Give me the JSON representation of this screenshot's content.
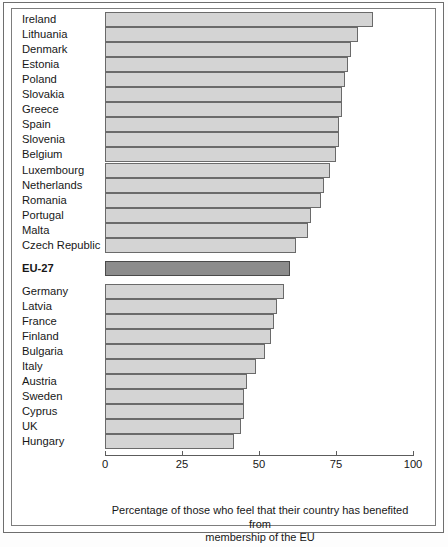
{
  "chart_data": {
    "type": "bar",
    "orientation": "horizontal",
    "title": "",
    "xlabel": "Percentage of those who feel that their country has benefited from membership of the EU",
    "ylabel": "",
    "xlim": [
      0,
      100
    ],
    "xticks": [
      0,
      25,
      50,
      75,
      100
    ],
    "xtick_labels": [
      "0",
      "25",
      "50",
      "75",
      "100"
    ],
    "grid": false,
    "legend": null,
    "categories": [
      "Ireland",
      "Lithuania",
      "Denmark",
      "Estonia",
      "Poland",
      "Slovakia",
      "Greece",
      "Spain",
      "Slovenia",
      "Belgium",
      "Luxembourg",
      "Netherlands",
      "Romania",
      "Portugal",
      "Malta",
      "Czech Republic",
      "EU-27",
      "Germany",
      "Latvia",
      "France",
      "Finland",
      "Bulgaria",
      "Italy",
      "Austria",
      "Sweden",
      "Cyprus",
      "UK",
      "Hungary"
    ],
    "values": [
      87,
      82,
      80,
      79,
      78,
      77,
      77,
      76,
      76,
      75,
      73,
      71,
      70,
      67,
      66,
      62,
      60,
      58,
      56,
      55,
      54,
      52,
      49,
      46,
      45,
      45,
      44,
      42
    ],
    "highlight_category": "EU-27",
    "colors": {
      "bar_fill": "#d4d4d4",
      "bar_edge": "#6a6a6a",
      "highlight_fill": "#8c8c8c",
      "highlight_edge": "#4a4a4a",
      "axis": "#5c5c5c",
      "text": "#171717",
      "background": "#ffffff"
    },
    "groups": [
      {
        "name": "above-average",
        "categories": [
          "Ireland",
          "Lithuania",
          "Denmark",
          "Estonia",
          "Poland",
          "Slovakia",
          "Greece",
          "Spain",
          "Slovenia",
          "Belgium",
          "Luxembourg",
          "Netherlands",
          "Romania",
          "Portugal",
          "Malta",
          "Czech Republic"
        ]
      },
      {
        "name": "eu-average",
        "categories": [
          "EU-27"
        ]
      },
      {
        "name": "below-average",
        "categories": [
          "Germany",
          "Latvia",
          "France",
          "Finland",
          "Bulgaria",
          "Italy",
          "Austria",
          "Sweden",
          "Cyprus",
          "UK",
          "Hungary"
        ]
      }
    ]
  },
  "caption": {
    "line1": "Percentage of those who feel that their country has benefited from",
    "line2": "membership of the EU"
  }
}
